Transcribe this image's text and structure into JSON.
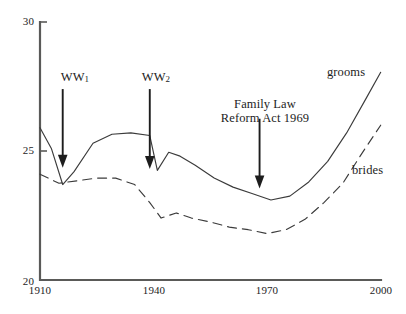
{
  "chart_data": {
    "type": "line",
    "title": "",
    "subtitle": "",
    "xlabel": "",
    "ylabel": "",
    "xlim": [
      1910,
      2000
    ],
    "ylim": [
      20,
      30
    ],
    "grid": false,
    "legend_position": "inline-right-end-of-lines",
    "x_ticks": [
      "1910",
      "1940",
      "1970",
      "2000"
    ],
    "x_tick_values": [
      1910,
      1940,
      1970,
      2000
    ],
    "y_ticks": [
      "20",
      "25",
      "30"
    ],
    "y_tick_values": [
      20,
      25,
      30
    ],
    "series": [
      {
        "name": "grooms",
        "style": "solid",
        "x": [
          1910,
          1913,
          1916,
          1919,
          1924,
          1929,
          1934,
          1939,
          1941,
          1944,
          1947,
          1951,
          1956,
          1961,
          1966,
          1971,
          1976,
          1981,
          1986,
          1991,
          1996,
          2000
        ],
        "values": [
          25.9,
          25.1,
          23.7,
          24.2,
          25.3,
          25.65,
          25.7,
          25.6,
          24.25,
          24.95,
          24.8,
          24.45,
          23.95,
          23.6,
          23.35,
          23.1,
          23.25,
          23.8,
          24.6,
          25.7,
          27.0,
          28.05
        ]
      },
      {
        "name": "brides",
        "style": "dashed",
        "x": [
          1910,
          1915,
          1920,
          1925,
          1930,
          1935,
          1939,
          1942,
          1946,
          1950,
          1955,
          1960,
          1965,
          1970,
          1975,
          1980,
          1985,
          1990,
          1995,
          2000
        ],
        "values": [
          24.1,
          23.75,
          23.85,
          23.95,
          23.95,
          23.7,
          23.0,
          22.4,
          22.6,
          22.4,
          22.25,
          22.05,
          21.95,
          21.8,
          21.95,
          22.35,
          23.0,
          23.75,
          24.9,
          26.0
        ]
      }
    ],
    "annotations": [
      {
        "id": "ww1",
        "label_lines": [
          "WW",
          "1"
        ],
        "label_text": "WW1",
        "x_year": 1916,
        "arrow_from_value": 27.4,
        "arrow_to_value": 24.35
      },
      {
        "id": "ww2",
        "label_lines": [
          "WW",
          "2"
        ],
        "label_text": "WW2",
        "x_year": 1939,
        "arrow_from_value": 27.4,
        "arrow_to_value": 24.3
      },
      {
        "id": "family-law-reform-act",
        "label_lines": [
          "Family Law",
          "Reform Act 1969"
        ],
        "label_text": "Family Law Reform Act 1969",
        "x_year": 1968,
        "arrow_from_value": 26.25,
        "arrow_to_value": 23.55
      }
    ],
    "series_labels": [
      {
        "text": "grooms",
        "for": "grooms"
      },
      {
        "text": "brides",
        "for": "brides"
      }
    ],
    "colors": {
      "axis": "#5a5a58",
      "line": "#3b3b3b",
      "arrow": "#1d1d1d",
      "text": "#1d1d1d",
      "background": "#ffffff"
    }
  }
}
